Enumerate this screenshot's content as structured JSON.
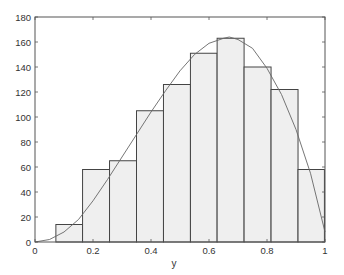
{
  "chart_data": {
    "type": "bar",
    "subtype": "histogram with fitted density curve",
    "title": "",
    "xlabel": "y",
    "ylabel": "",
    "xlim": [
      0,
      1
    ],
    "ylim": [
      0,
      180
    ],
    "grid": false,
    "legend": null,
    "x_ticks": [
      0,
      0.2,
      0.4,
      0.6,
      0.8,
      1
    ],
    "x_tick_labels": [
      "0",
      "0.2",
      "0.4",
      "0.6",
      "0.8",
      "1"
    ],
    "y_ticks": [
      0,
      20,
      40,
      60,
      80,
      100,
      120,
      140,
      160,
      180
    ],
    "y_tick_labels": [
      "0",
      "20",
      "40",
      "60",
      "80",
      "100",
      "120",
      "140",
      "160",
      "180"
    ],
    "bins": {
      "edges": [
        0.072,
        0.164,
        0.257,
        0.35,
        0.443,
        0.536,
        0.628,
        0.721,
        0.814,
        0.907,
        0.998
      ],
      "counts": [
        14,
        58,
        65,
        105,
        126,
        151,
        163,
        140,
        122,
        58
      ]
    },
    "series": [
      {
        "name": "histogram",
        "type": "bar",
        "categories": [
          "0.07-0.16",
          "0.16-0.26",
          "0.26-0.35",
          "0.35-0.44",
          "0.44-0.54",
          "0.54-0.63",
          "0.63-0.72",
          "0.72-0.81",
          "0.81-0.91",
          "0.91-1.00"
        ],
        "values": [
          14,
          58,
          65,
          105,
          126,
          151,
          163,
          140,
          122,
          58
        ]
      },
      {
        "name": "fitted-density-curve",
        "type": "line",
        "x": [
          0,
          0.05,
          0.1,
          0.15,
          0.2,
          0.25,
          0.3,
          0.35,
          0.4,
          0.45,
          0.5,
          0.55,
          0.6,
          0.65,
          0.67,
          0.7,
          0.75,
          0.8,
          0.85,
          0.9,
          0.95,
          1.0
        ],
        "values": [
          0,
          2,
          8,
          18,
          33,
          50,
          68,
          86,
          104,
          121,
          137,
          150,
          159,
          163,
          164,
          162,
          155,
          139,
          118,
          90,
          55,
          8
        ]
      }
    ],
    "colors": {
      "bar_fill": "#efefef",
      "bar_edge": "#444444",
      "curve": "#666666",
      "axes": "#555555"
    }
  }
}
